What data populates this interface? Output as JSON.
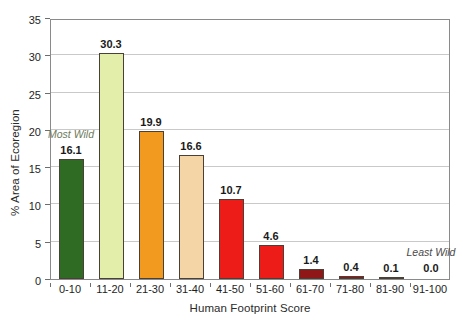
{
  "chart_data": {
    "type": "bar",
    "title": "",
    "subtitle": "",
    "xlabel": "Human Footprint Score",
    "ylabel": "% Area of Ecoregion",
    "categories": [
      "0-10",
      "11-20",
      "21-30",
      "31-40",
      "41-50",
      "51-60",
      "61-70",
      "71-80",
      "81-90",
      "91-100"
    ],
    "values": [
      16.1,
      30.3,
      19.9,
      16.6,
      10.7,
      4.6,
      1.4,
      0.4,
      0.1,
      0.0
    ],
    "value_labels": [
      "16.1",
      "30.3",
      "19.9",
      "16.6",
      "10.7",
      "4.6",
      "1.4",
      "0.4",
      "0.1",
      "0.0"
    ],
    "bar_colors": [
      "#2f6b23",
      "#e4eeab",
      "#f29a1f",
      "#f4d5a6",
      "#ee1c18",
      "#ee1c18",
      "#8f1717",
      "#8f1717",
      "#8f1717",
      "#8f1717"
    ],
    "bar_edge_color": "#4a4036",
    "ylim": [
      0,
      35
    ],
    "yticks": [
      0,
      5,
      10,
      15,
      20,
      25,
      30,
      35
    ],
    "ytick_labels": [
      "0",
      "5",
      "10",
      "15",
      "20",
      "25",
      "30",
      "35"
    ],
    "grid": "horizontal",
    "legend": "none",
    "annotations": [
      {
        "text": "Most Wild",
        "category": "0-10",
        "style": "italic",
        "color": "#6e7a5a"
      },
      {
        "text": "Least Wild",
        "category": "91-100",
        "style": "italic",
        "color": "#4a4a4a"
      }
    ]
  }
}
